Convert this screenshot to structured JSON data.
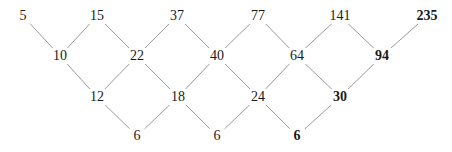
{
  "diagram": {
    "line_color": "#9a9a9a",
    "rows": [
      {
        "y": 16,
        "nodes": [
          {
            "label": "5",
            "x": 23,
            "bold": false
          },
          {
            "label": "15",
            "x": 97,
            "bold": false
          },
          {
            "label": "37",
            "x": 177,
            "bold": false
          },
          {
            "label": "77",
            "x": 258,
            "bold": false
          },
          {
            "label": "141",
            "x": 340,
            "bold": false
          },
          {
            "label": "235",
            "x": 427,
            "bold": true
          }
        ]
      },
      {
        "y": 56,
        "nodes": [
          {
            "label": "10",
            "x": 60,
            "bold": false
          },
          {
            "label": "22",
            "x": 137,
            "bold": false
          },
          {
            "label": "40",
            "x": 217,
            "bold": false
          },
          {
            "label": "64",
            "x": 297,
            "bold": false
          },
          {
            "label": "94",
            "x": 382,
            "bold": true
          }
        ]
      },
      {
        "y": 97,
        "nodes": [
          {
            "label": "12",
            "x": 97,
            "bold": false
          },
          {
            "label": "18",
            "x": 178,
            "bold": false
          },
          {
            "label": "24",
            "x": 258,
            "bold": false
          },
          {
            "label": "30",
            "x": 340,
            "bold": true
          }
        ]
      },
      {
        "y": 136,
        "nodes": [
          {
            "label": "6",
            "x": 137,
            "bold": false
          },
          {
            "label": "6",
            "x": 217,
            "bold": false
          },
          {
            "label": "6",
            "x": 297,
            "bold": true
          }
        ]
      }
    ]
  }
}
